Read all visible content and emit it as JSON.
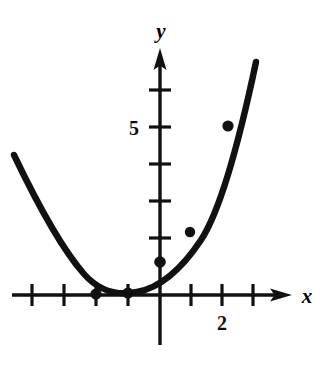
{
  "figure": {
    "kind": "coordinate-plane-parabola-plot",
    "background_color": "#ffffff",
    "ink_color": "#111111"
  },
  "axes": {
    "x_axis_label": "x",
    "y_axis_label": "y",
    "x_tick_label": "2",
    "y_tick_label": "5",
    "x_tick_label_value": 2,
    "y_tick_label_value": 5,
    "origin_px": [
      160,
      295
    ],
    "x_unit_px": 31,
    "y_unit_px": 37,
    "x_ticks": [
      -4,
      -3,
      -2,
      -1,
      1,
      2,
      3
    ],
    "y_ticks": [
      1,
      2,
      3,
      4,
      5,
      6
    ],
    "x_range": [
      -4.8,
      3.9
    ],
    "y_range": [
      -1.9,
      6.6
    ],
    "grid": false,
    "arrowheads": [
      "x-positive",
      "y-positive"
    ]
  },
  "chart_data": {
    "type": "line",
    "title": "",
    "subtitle": "",
    "xlabel": "x",
    "ylabel": "y",
    "xlim": [
      -4.8,
      3.9
    ],
    "ylim": [
      -1.9,
      6.6
    ],
    "grid": false,
    "legend": "none",
    "series": [
      {
        "name": "parabola",
        "kind": "curve",
        "equation": "y = x^2 + 3x + 2",
        "vertex": [
          -1.5,
          -0.25
        ],
        "x_intercepts": [
          -2,
          -1
        ],
        "y_intercept": 2,
        "x": [
          -4.7,
          -4.4,
          -4.0,
          -3.6,
          -3.2,
          -2.8,
          -2.4,
          -2.0,
          -1.6,
          -1.2,
          -0.8,
          -0.4,
          0.0,
          0.4,
          0.8,
          1.2,
          1.6,
          2.0,
          2.4,
          2.8,
          3.1
        ],
        "y": [
          9.99,
          8.16,
          6.0,
          4.16,
          2.64,
          1.44,
          0.56,
          0.0,
          -0.24,
          -0.16,
          0.24,
          0.96,
          2.0,
          3.36,
          5.04,
          7.04,
          9.36,
          12.0,
          14.96,
          18.24,
          20.9
        ]
      },
      {
        "name": "plotted-points",
        "kind": "scatter",
        "marker": "filled-dot",
        "points": [
          {
            "x": -2,
            "y": 0,
            "px": [
              96,
              295
            ]
          },
          {
            "x": -1,
            "y": 0,
            "px": [
              128,
              295
            ]
          },
          {
            "x": 0,
            "y": 0.86,
            "px": [
              160,
              263
            ]
          },
          {
            "x": 0.97,
            "y": 1.7,
            "px": [
              190,
              232
            ]
          },
          {
            "x": 2.19,
            "y": 4.54,
            "px": [
              228,
              127
            ]
          }
        ]
      }
    ]
  },
  "curve_path": "M 14,155 C 36,201 62,249 84,274 C 99,291 117,296 137,292 C 159,288 181,270 201,240 C 222,208 241,133 256,62",
  "markers": [
    {
      "cx": 96,
      "cy": 294,
      "r": 5.6,
      "name": "data-point-root-left"
    },
    {
      "cx": 128,
      "cy": 293,
      "r": 5.6,
      "name": "data-point-root-right"
    },
    {
      "cx": 160,
      "cy": 262,
      "r": 5.8,
      "name": "data-point-y-intercept"
    },
    {
      "cx": 190,
      "cy": 232,
      "r": 5.2,
      "name": "data-point-mid"
    },
    {
      "cx": 228,
      "cy": 126,
      "r": 5.6,
      "name": "data-point-upper"
    }
  ]
}
